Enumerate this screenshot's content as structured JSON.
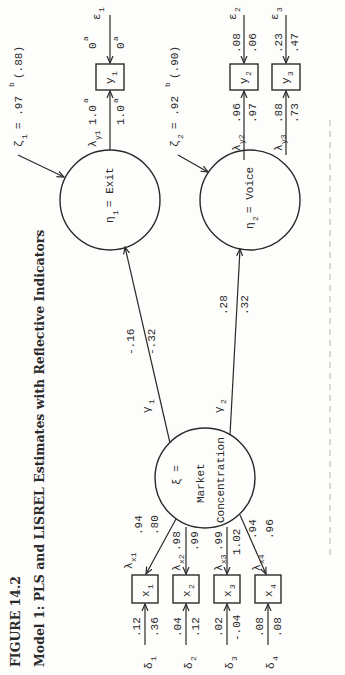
{
  "figure": {
    "label": "FIGURE 14.2",
    "caption": "Model 1: PLS and LISREL Estimates with Reflective Indicators",
    "orientation": "rotated 90° counter-clockwise",
    "estimate_format": "first value = PLS, second value = LISREL"
  },
  "latent": {
    "xi": {
      "symbol": "ξ =",
      "name_line1": "Market",
      "name_line2": "Concentration"
    },
    "eta1": {
      "symbol": "η",
      "sub": "1",
      "name": "= Exit"
    },
    "eta2": {
      "symbol": "η",
      "sub": "2",
      "name": "= Voice"
    }
  },
  "disturbances": {
    "zeta1": {
      "symbol": "ζ",
      "sub": "1",
      "text": "= .97",
      "sup": "b",
      "paren": "(.88)"
    },
    "zeta2": {
      "symbol": "ζ",
      "sub": "2",
      "text": "= .92",
      "sup": "b",
      "paren": "(.90)"
    }
  },
  "structural_paths": [
    {
      "symbol": "γ",
      "sub": "1",
      "pls": "-.16",
      "lisrel": "-.32",
      "to": "η1 = Exit"
    },
    {
      "symbol": "γ",
      "sub": "2",
      "pls": ".28",
      "lisrel": ".32",
      "to": "η2 = Voice"
    }
  ],
  "x_indicators": [
    {
      "name": "x",
      "sub": "1",
      "lambda": "λx1",
      "lambda_sub": "x1",
      "load_pls": ".94",
      "load_lisrel": ".80",
      "delta": "δ",
      "delta_sub": "1",
      "err_pls": ".12",
      "err_lisrel": ".36"
    },
    {
      "name": "x",
      "sub": "2",
      "lambda": "λx2",
      "lambda_sub": "x2",
      "load_pls": ".98",
      "load_lisrel": ".99",
      "delta": "δ",
      "delta_sub": "2",
      "err_pls": ".04",
      "err_lisrel": ".12"
    },
    {
      "name": "x",
      "sub": "3",
      "lambda": "λx3",
      "lambda_sub": "x3",
      "load_pls": ".99",
      "load_lisrel": "1.02",
      "delta": "δ",
      "delta_sub": "3",
      "err_pls": ".02",
      "err_lisrel": "-.04"
    },
    {
      "name": "x",
      "sub": "4",
      "lambda": "λx4",
      "lambda_sub": "x4",
      "load_pls": ".94",
      "load_lisrel": ".96",
      "delta": "δ",
      "delta_sub": "4",
      "err_pls": ".08",
      "err_lisrel": ".08"
    }
  ],
  "y_indicators": [
    {
      "name": "y",
      "sub": "1",
      "lambda_sub": "y1",
      "load_pls": "1.0",
      "load_pls_sup": "a",
      "load_lisrel": "1.0",
      "load_lisrel_sup": "a",
      "epsilon": "ε",
      "eps_sub": "1",
      "err_pls": "0",
      "err_pls_sup": "a",
      "err_lisrel": "0",
      "err_lisrel_sup": "a"
    },
    {
      "name": "y",
      "sub": "2",
      "lambda_sub": "y2",
      "load_pls": ".96",
      "load_lisrel": ".97",
      "epsilon": "ε",
      "eps_sub": "2",
      "err_pls": ".08",
      "err_lisrel": ".06"
    },
    {
      "name": "y",
      "sub": "3",
      "lambda_sub": "y3",
      "load_pls": ".88",
      "load_lisrel": ".73",
      "epsilon": "ε",
      "eps_sub": "3",
      "err_pls": ".23",
      "err_lisrel": ".47"
    }
  ],
  "symbols": {
    "lambda": "λ",
    "gamma": "γ"
  }
}
